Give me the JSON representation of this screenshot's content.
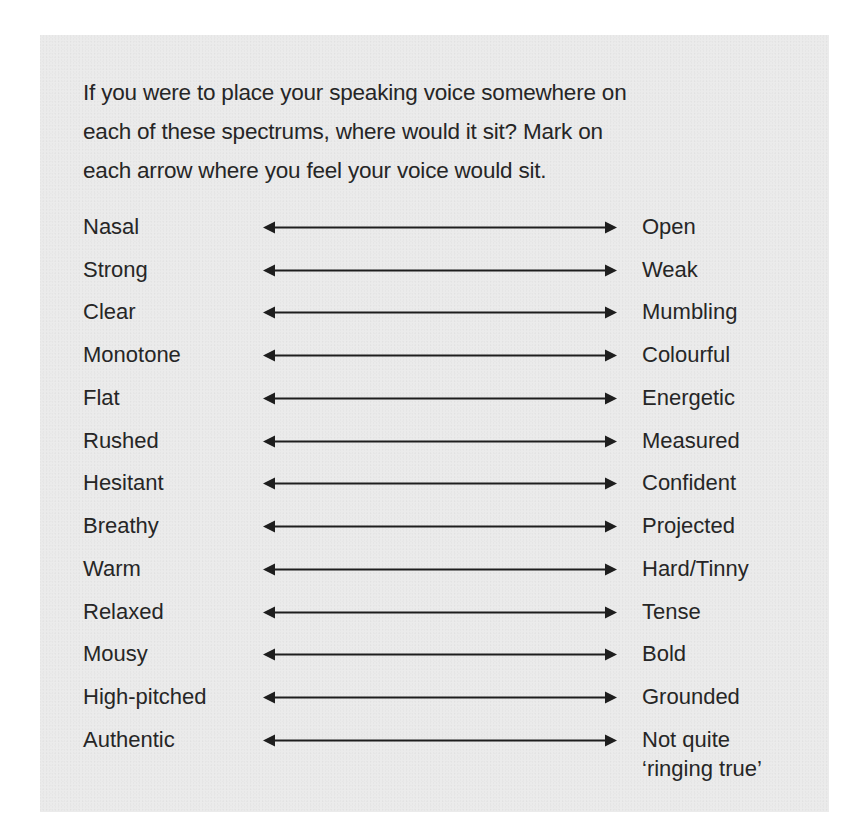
{
  "intro": {
    "lines": [
      "If you were to place your speaking voice somewhere on",
      "each of these spectrums, where would it sit? Mark on",
      "each arrow where you feel your voice would sit."
    ]
  },
  "spectrums": [
    {
      "left": "Nasal",
      "right": "Open"
    },
    {
      "left": "Strong",
      "right": "Weak"
    },
    {
      "left": "Clear",
      "right": "Mumbling"
    },
    {
      "left": "Monotone",
      "right": "Colourful"
    },
    {
      "left": "Flat",
      "right": "Energetic"
    },
    {
      "left": "Rushed",
      "right": "Measured"
    },
    {
      "left": "Hesitant",
      "right": "Confident"
    },
    {
      "left": "Breathy",
      "right": "Projected"
    },
    {
      "left": "Warm",
      "right": "Hard/Tinny"
    },
    {
      "left": "Relaxed",
      "right": "Tense"
    },
    {
      "left": "Mousy",
      "right": "Bold"
    },
    {
      "left": "High-pitched",
      "right": "Grounded"
    },
    {
      "left": "Authentic",
      "right": "Not quite",
      "right_line2": "‘ringing true’"
    }
  ],
  "icons": {
    "arrow": "double-headed-arrow"
  },
  "colors": {
    "panel_background": "#ebebeb",
    "text": "#262626",
    "arrow": "#1e1e1e"
  }
}
